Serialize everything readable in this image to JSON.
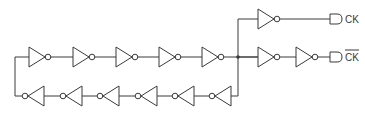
{
  "diagram": {
    "colors": {
      "stroke": "#3a3a3a",
      "background": "#ffffff"
    },
    "ring": {
      "top_row_inverters": 5,
      "bottom_row_inverters": 6,
      "direction_top": "right",
      "direction_bottom": "left"
    },
    "outputs": [
      {
        "label": "CK",
        "overline": false,
        "inverters": 1
      },
      {
        "label": "CK",
        "overline": true,
        "inverters": 2
      }
    ]
  }
}
